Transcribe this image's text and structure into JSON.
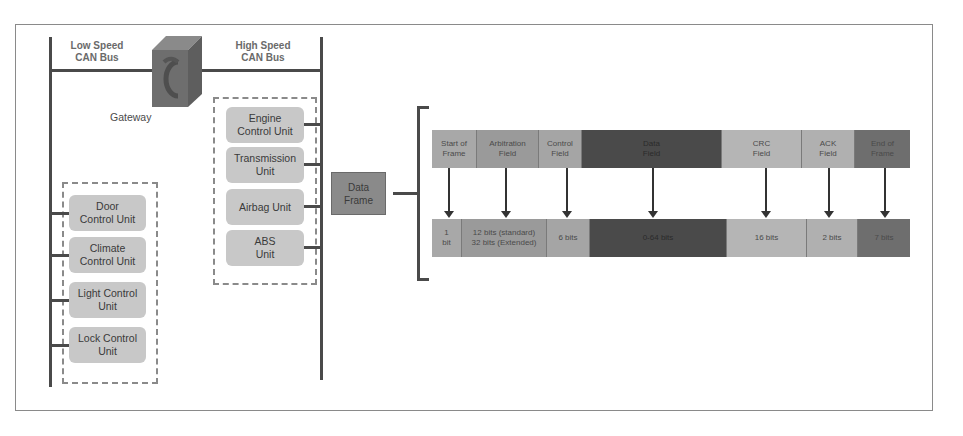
{
  "diagram": {
    "low_speed_bus": {
      "label": "Low Speed\nCAN Bus"
    },
    "high_speed_bus": {
      "label": "High Speed\nCAN Bus"
    },
    "gateway": {
      "label": "Gateway",
      "icon": "gateway-cube-icon"
    },
    "low_speed_units": [
      {
        "label": "Door\nControl Unit"
      },
      {
        "label": "Climate\nControl Unit"
      },
      {
        "label": "Light Control\nUnit"
      },
      {
        "label": "Lock Control\nUnit"
      }
    ],
    "high_speed_units": [
      {
        "label": "Engine\nControl Unit"
      },
      {
        "label": "Transmission\nUnit"
      },
      {
        "label": "Airbag Unit"
      },
      {
        "label": "ABS\nUnit"
      }
    ],
    "data_frame": {
      "label": "Data\nFrame"
    },
    "frame_fields": [
      {
        "name": "Start of\nFrame",
        "size": "1\nbit",
        "color": "#a8a8a8"
      },
      {
        "name": "Arbitration\nField",
        "size": "12 bits (standard)\n32 bits (Extended)",
        "color": "#9a9a9a"
      },
      {
        "name": "Control\nField",
        "size": "6 bits",
        "color": "#a5a5a5"
      },
      {
        "name": "Data\nField",
        "size": "0-64 bits",
        "color": "#4a4a4a"
      },
      {
        "name": "CRC\nField",
        "size": "16 bits",
        "color": "#b5b5b5"
      },
      {
        "name": "ACK\nField",
        "size": "2 bits",
        "color": "#b0b0b0"
      },
      {
        "name": "End of\nFrame",
        "size": "7 bits",
        "color": "#6e6e6e"
      }
    ]
  }
}
